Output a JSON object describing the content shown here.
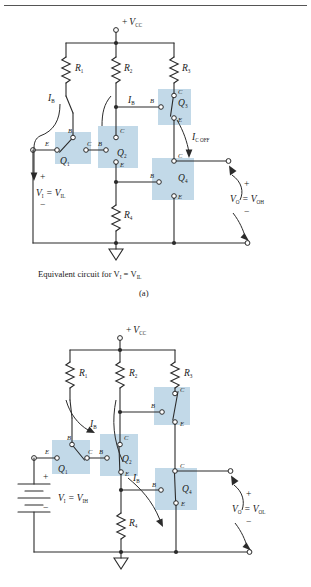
{
  "figure": {
    "type": "two-panel-circuit-diagram",
    "highlight_color": "#c2d9e8",
    "wire_color": "#2b2b2b",
    "background": "#ffffff"
  },
  "panel_a": {
    "id": "a",
    "caption": "Equivalent circuit for  V",
    "caption_sub1": "I",
    "caption_mid": " = V",
    "caption_sub2": "IL",
    "panel_label": "(a)",
    "supply": {
      "sign": "+",
      "name": "V",
      "sub": "CC"
    },
    "resistors": [
      {
        "name": "R",
        "sub": "1"
      },
      {
        "name": "R",
        "sub": "2"
      },
      {
        "name": "R",
        "sub": "3"
      },
      {
        "name": "R",
        "sub": "4"
      }
    ],
    "transistors": [
      {
        "name": "Q",
        "sub": "1",
        "terminals": [
          "E",
          "B",
          "C"
        ],
        "state": "on"
      },
      {
        "name": "Q",
        "sub": "2",
        "terminals": [
          "C",
          "B",
          "E"
        ],
        "state": "off"
      },
      {
        "name": "Q",
        "sub": "3",
        "terminals": [
          "B",
          "C",
          "E"
        ],
        "state": "on"
      },
      {
        "name": "Q",
        "sub": "4",
        "terminals": [
          "C",
          "B",
          "E"
        ],
        "state": "off"
      }
    ],
    "currents": [
      {
        "name": "I",
        "sub": "B"
      },
      {
        "name": "I",
        "sub": "B"
      },
      {
        "name": "I",
        "sub": "C OFF"
      }
    ],
    "input": {
      "plus": "+",
      "minus": "−",
      "name": "V",
      "sub": "I",
      "eq": " = V",
      "sub2": "IL"
    },
    "output": {
      "plus": "+",
      "minus": "−",
      "name": "V",
      "sub": "O",
      "eq": " = V",
      "sub2": "OH"
    }
  },
  "panel_b": {
    "id": "b",
    "supply": {
      "sign": "+",
      "name": "V",
      "sub": "CC"
    },
    "resistors": [
      {
        "name": "R",
        "sub": "1"
      },
      {
        "name": "R",
        "sub": "2"
      },
      {
        "name": "R",
        "sub": "3"
      },
      {
        "name": "R",
        "sub": "4"
      }
    ],
    "transistors": [
      {
        "name": "Q",
        "sub": "1",
        "terminals": [
          "E",
          "B",
          "C"
        ],
        "state": "off"
      },
      {
        "name": "Q",
        "sub": "2",
        "terminals": [
          "C",
          "B",
          "E"
        ],
        "state": "on"
      },
      {
        "name": "",
        "sub": "",
        "terminals": [
          "B",
          "C",
          "E"
        ],
        "state": "off"
      },
      {
        "name": "Q",
        "sub": "4",
        "terminals": [
          "C",
          "B",
          "E"
        ],
        "state": "on"
      }
    ],
    "currents": [
      {
        "name": "I",
        "sub": "B"
      },
      {
        "name": "I",
        "sub": "B"
      }
    ],
    "source_symbol": "battery",
    "input": {
      "plus": "+",
      "minus": "−",
      "name": "V",
      "sub": "I",
      "eq": " = V",
      "sub2": "IH"
    },
    "output": {
      "plus": "+",
      "minus": "−",
      "name": "V",
      "sub": "O",
      "eq": " = V",
      "sub2": "OL"
    }
  }
}
